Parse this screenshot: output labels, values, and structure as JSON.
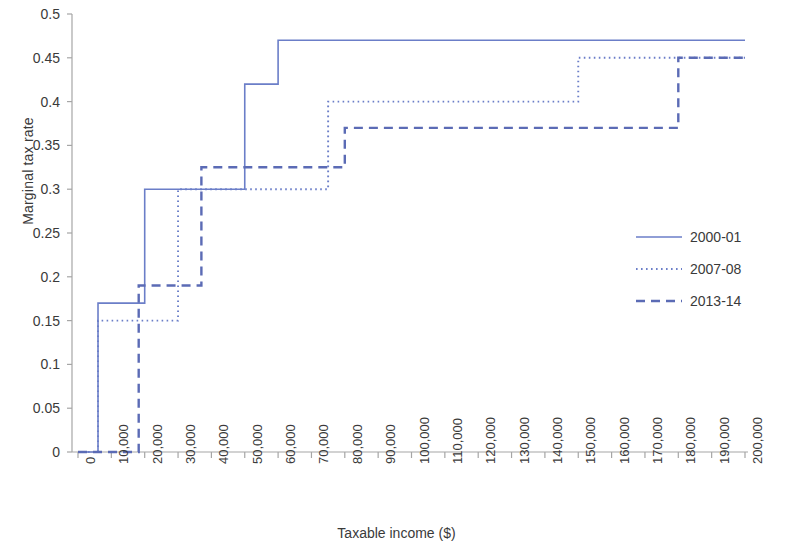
{
  "chart_data": {
    "type": "line",
    "title": "",
    "subtitle": "",
    "xlabel": "Taxable income ($)",
    "ylabel": "Marginal tax rate",
    "xlim": [
      0,
      200000
    ],
    "ylim": [
      0,
      0.5
    ],
    "grid": false,
    "legend_position": "right",
    "accent_color": "#6b7ec8",
    "axis_color": "#a6a6a6",
    "text_color": "#3a3a3a",
    "xticks": [
      0,
      10000,
      20000,
      30000,
      40000,
      50000,
      60000,
      70000,
      80000,
      90000,
      100000,
      110000,
      120000,
      130000,
      140000,
      150000,
      160000,
      170000,
      180000,
      190000,
      200000
    ],
    "xtick_labels": [
      "0",
      "10,000",
      "20,000",
      "30,000",
      "40,000",
      "50,000",
      "60,000",
      "70,000",
      "80,000",
      "90,000",
      "100,000",
      "110,000",
      "120,000",
      "130,000",
      "140,000",
      "150,000",
      "160,000",
      "170,000",
      "180,000",
      "190,000",
      "200,000"
    ],
    "yticks": [
      0,
      0.05,
      0.1,
      0.15,
      0.2,
      0.25,
      0.3,
      0.35,
      0.4,
      0.45,
      0.5
    ],
    "ytick_labels": [
      "0",
      "0.05",
      "0.1",
      "0.15",
      "0.2",
      "0.25",
      "0.3",
      "0.35",
      "0.4",
      "0.45",
      "0.5"
    ],
    "series": [
      {
        "name": "2000-01",
        "style": "solid",
        "color": "#6b7ec8",
        "steps": [
          {
            "x": 0,
            "rate": 0
          },
          {
            "x": 6000,
            "rate": 0.17
          },
          {
            "x": 20000,
            "rate": 0.3
          },
          {
            "x": 50000,
            "rate": 0.42
          },
          {
            "x": 60000,
            "rate": 0.47
          },
          {
            "x": 200000,
            "rate": 0.47
          }
        ]
      },
      {
        "name": "2007-08",
        "style": "dotted",
        "color": "#6b7ec8",
        "steps": [
          {
            "x": 0,
            "rate": 0
          },
          {
            "x": 6000,
            "rate": 0.15
          },
          {
            "x": 30000,
            "rate": 0.3
          },
          {
            "x": 75000,
            "rate": 0.4
          },
          {
            "x": 150000,
            "rate": 0.45
          },
          {
            "x": 200000,
            "rate": 0.45
          }
        ]
      },
      {
        "name": "2013-14",
        "style": "dashed",
        "color": "#5b6bb5",
        "steps": [
          {
            "x": 0,
            "rate": 0
          },
          {
            "x": 18200,
            "rate": 0.19
          },
          {
            "x": 37000,
            "rate": 0.325
          },
          {
            "x": 80000,
            "rate": 0.37
          },
          {
            "x": 180000,
            "rate": 0.45
          },
          {
            "x": 200000,
            "rate": 0.45
          }
        ]
      }
    ],
    "legend": [
      {
        "label": "2000-01",
        "style": "solid"
      },
      {
        "label": "2007-08",
        "style": "dotted"
      },
      {
        "label": "2013-14",
        "style": "dashed"
      }
    ]
  }
}
